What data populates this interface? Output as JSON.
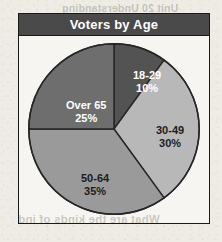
{
  "page": {
    "background_color": "#efece6",
    "bleed_through_top": "Unit  20 Understanding",
    "bleed_through_bottom": "What are the kinds of ind"
  },
  "chart_frame": {
    "border_color": "#1a1a1a",
    "plot_background": "#f7f5f1",
    "title_bar_color": "#4a4a4a",
    "title_text_color": "#ffffff"
  },
  "chart_data": {
    "type": "pie",
    "title": "Voters by Age",
    "xlabel": "",
    "ylabel": "",
    "start_angle_deg": 0,
    "direction": "clockwise",
    "categories": [
      "18-29",
      "30-49",
      "50-64",
      "Over 65"
    ],
    "values": [
      10,
      30,
      35,
      25
    ],
    "value_unit": "%",
    "total": 100,
    "legend": "none",
    "grid": false,
    "slices": [
      {
        "label": "18-29",
        "value": 10,
        "display_value": "10%",
        "color": "#535353",
        "label_color": "#ffffff",
        "start_angle_deg": 0,
        "end_angle_deg": 36,
        "label_x": 114,
        "label_y": 33
      },
      {
        "label": "30-49",
        "value": 30,
        "display_value": "30%",
        "color": "#b8b8b8",
        "label_color": "#1c1c1c",
        "start_angle_deg": 36,
        "end_angle_deg": 144,
        "label_x": 137,
        "label_y": 88
      },
      {
        "label": "50-64",
        "value": 35,
        "display_value": "35%",
        "color": "#9a9a9a",
        "label_color": "#1c1c1c",
        "start_angle_deg": 144,
        "end_angle_deg": 270,
        "label_x": 62,
        "label_y": 136
      },
      {
        "label": "Over 65",
        "value": 25,
        "display_value": "25%",
        "color": "#6e6e6e",
        "label_color": "#ffffff",
        "start_angle_deg": 270,
        "end_angle_deg": 360,
        "label_x": 47,
        "label_y": 63
      }
    ]
  }
}
